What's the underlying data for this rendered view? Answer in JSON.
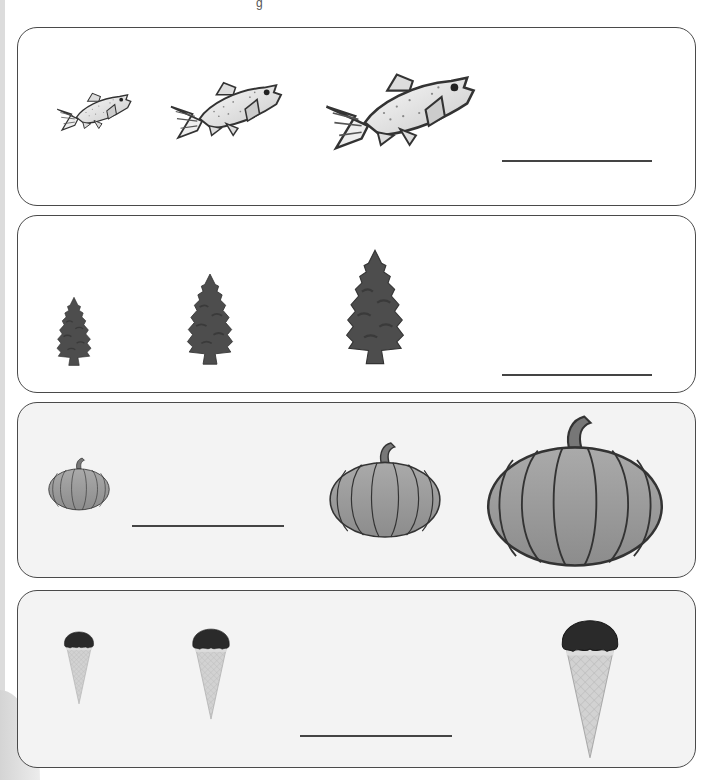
{
  "worksheet": {
    "title_fragment": "g",
    "rows": [
      {
        "id": "fish",
        "subject": "fish",
        "items": [
          {
            "label": "small fish",
            "size": "small"
          },
          {
            "label": "medium fish",
            "size": "medium"
          },
          {
            "label": "large fish",
            "size": "large"
          }
        ],
        "answer_blank": {
          "position": "after",
          "value": ""
        }
      },
      {
        "id": "trees",
        "subject": "pine tree",
        "items": [
          {
            "label": "small tree",
            "size": "small"
          },
          {
            "label": "medium tree",
            "size": "medium"
          },
          {
            "label": "large tree",
            "size": "large"
          }
        ],
        "answer_blank": {
          "position": "after",
          "value": ""
        }
      },
      {
        "id": "pumpkins",
        "subject": "pumpkin",
        "items": [
          {
            "label": "small pumpkin",
            "size": "small"
          },
          {
            "label": "medium pumpkin",
            "size": "medium"
          },
          {
            "label": "large pumpkin",
            "size": "large"
          }
        ],
        "answer_blank": {
          "position": "second",
          "value": ""
        }
      },
      {
        "id": "ice-cream",
        "subject": "ice cream cone",
        "items": [
          {
            "label": "small cone",
            "size": "small"
          },
          {
            "label": "medium cone",
            "size": "medium"
          },
          {
            "label": "large cone",
            "size": "large"
          }
        ],
        "answer_blank": {
          "position": "third",
          "value": ""
        }
      }
    ]
  },
  "colors": {
    "border": "#4a4a4a",
    "tree": "#4d4d4d",
    "pumpkin": "#9a9a9a",
    "scoop": "#2a2a2a",
    "cone": "#cfcfcf"
  }
}
